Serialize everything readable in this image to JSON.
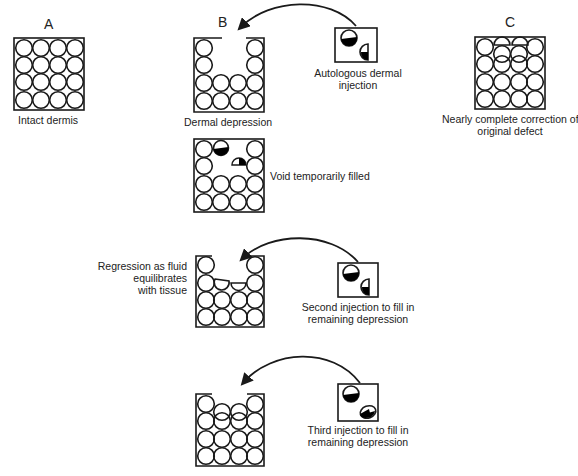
{
  "panels": {
    "A": {
      "letter": "A",
      "caption": "Intact dermis"
    },
    "B": {
      "letter": "B",
      "caption": "Dermal depression"
    },
    "C": {
      "letter": "C",
      "caption_line1": "Nearly complete correction of",
      "caption_line2": "original defect"
    }
  },
  "injections": {
    "first": {
      "line1": "Autologous dermal",
      "line2": "injection"
    },
    "second": {
      "line1": "Second injection to fill in",
      "line2": "remaining depression"
    },
    "third": {
      "line1": "Third injection to fill in",
      "line2": "remaining depression"
    }
  },
  "steps": {
    "void_filled": "Void temporarily filled",
    "regression": {
      "line1": "Regression as fluid",
      "line2": "equilibrates",
      "line3": "with tissue"
    }
  },
  "colors": {
    "stroke": "#1a1a1a",
    "fill": "#000000",
    "background": "#ffffff"
  }
}
